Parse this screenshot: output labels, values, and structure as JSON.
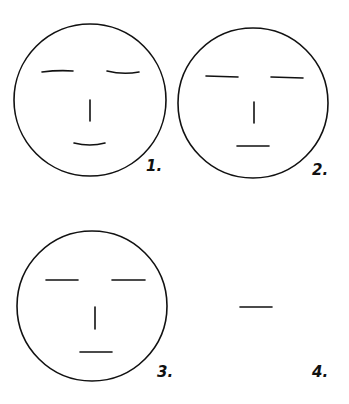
{
  "colors": {
    "stroke": "#111111",
    "background": "#ffffff"
  },
  "panels": [
    {
      "label": "1.",
      "description": "face with curved closed eyes and smiling mouth"
    },
    {
      "label": "2.",
      "description": "face with straight eyes and straight mouth"
    },
    {
      "label": "3.",
      "description": "face with straight eyes, nose and straight mouth"
    },
    {
      "label": "4.",
      "description": "single horizontal line, no face outline"
    }
  ]
}
